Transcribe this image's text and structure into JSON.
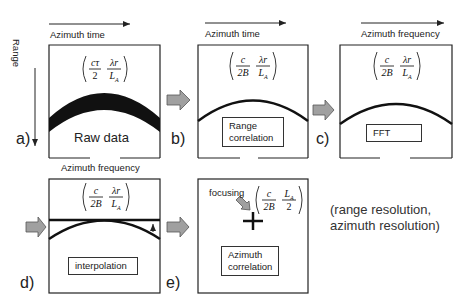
{
  "axes": {
    "range": "Range",
    "azimuth_time": "Azimuth time",
    "azimuth_frequency": "Azimuth frequency"
  },
  "panels": [
    {
      "id": "a",
      "label": "a)",
      "axis_top": "Azimuth time",
      "formula": {
        "num1": "cτ",
        "den1": "2",
        "num2": "λr",
        "den2": "L_A"
      },
      "box_text": "Raw data"
    },
    {
      "id": "b",
      "label": "b)",
      "axis_top": "Azimuth time",
      "formula": {
        "num1": "c",
        "den1": "2B",
        "num2": "λr",
        "den2": "L_A"
      },
      "box_text": "Range correlation"
    },
    {
      "id": "c",
      "label": "c)",
      "axis_top": "Azimuth frequency",
      "formula": {
        "num1": "c",
        "den1": "2B",
        "num2": "λr",
        "den2": "L_A"
      },
      "box_text": "FFT"
    },
    {
      "id": "d",
      "label": "d)",
      "axis_top": "Azimuth frequency",
      "formula": {
        "num1": "c",
        "den1": "2B",
        "num2": "λr",
        "den2": "L_A"
      },
      "box_text": "interpolation"
    },
    {
      "id": "e",
      "label": "e)",
      "annotation": "focusing",
      "formula": {
        "num1": "c",
        "den1": "2B",
        "num2": "L_A",
        "den2": "2"
      },
      "box_text": "Azimuth correlation"
    }
  ],
  "result": {
    "line1": "(range resolution,",
    "line2": "azimuth resolution)"
  },
  "colors": {
    "line": "#111111",
    "arrow_fill": "#a0a0a0",
    "arrow_stroke": "#555555"
  }
}
